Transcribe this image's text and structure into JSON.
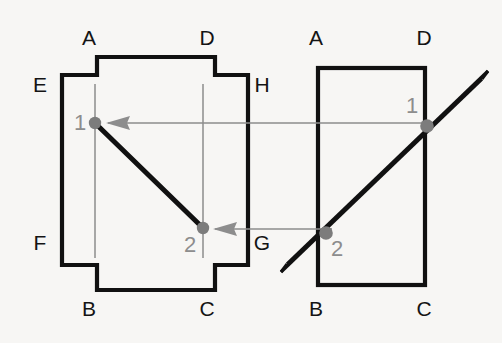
{
  "canvas": {
    "width": 502,
    "height": 343,
    "background": "#f7f6f4"
  },
  "colors": {
    "outline": "#111111",
    "projection_line": "#8d8d8d",
    "point_marker": "#7c7c7c",
    "vertex_label": "#141414",
    "point_label": "#8d8d8d"
  },
  "views": {
    "front": {
      "name": "front-view",
      "shape": "cross-polygon",
      "vertex_labels": [
        {
          "id": "front-label-A",
          "text": "A",
          "x": 89,
          "y": 45
        },
        {
          "id": "front-label-D",
          "text": "D",
          "x": 207,
          "y": 45
        },
        {
          "id": "front-label-E",
          "text": "E",
          "x": 40,
          "y": 92
        },
        {
          "id": "front-label-H",
          "text": "H",
          "x": 255,
          "y": 92
        },
        {
          "id": "front-label-F",
          "text": "F",
          "x": 40,
          "y": 250
        },
        {
          "id": "front-label-G",
          "text": "G",
          "x": 255,
          "y": 250
        },
        {
          "id": "front-label-B",
          "text": "B",
          "x": 89,
          "y": 316
        },
        {
          "id": "front-label-C",
          "text": "C",
          "x": 207,
          "y": 316
        }
      ],
      "points": [
        {
          "id": "front-point-1",
          "label": "1",
          "x": 95,
          "y": 123,
          "label_x": 80,
          "label_y": 128
        },
        {
          "id": "front-point-2",
          "label": "2",
          "x": 203,
          "y": 228,
          "label_x": 186,
          "label_y": 252
        }
      ],
      "line_segment": {
        "from": "1",
        "to": "2"
      }
    },
    "side": {
      "name": "side-view",
      "shape": "rectangle",
      "vertex_labels": [
        {
          "id": "side-label-A",
          "text": "A",
          "x": 310,
          "y": 45
        },
        {
          "id": "side-label-D",
          "text": "D",
          "x": 417,
          "y": 45
        },
        {
          "id": "side-label-B",
          "text": "B",
          "x": 310,
          "y": 316
        },
        {
          "id": "side-label-C",
          "text": "C",
          "x": 417,
          "y": 316
        }
      ],
      "points": [
        {
          "id": "side-point-1",
          "label": "1",
          "x": 425,
          "y": 125,
          "label_x": 411,
          "label_y": 112
        },
        {
          "id": "side-point-2",
          "label": "2",
          "x": 325,
          "y": 232,
          "label_x": 330,
          "label_y": 255
        }
      ],
      "rod": {
        "from_x": 283,
        "from_y": 268,
        "to_x": 486,
        "to_y": 74
      }
    }
  },
  "projection_lines": [
    {
      "id": "projection-line-1",
      "from_x": 425,
      "from_y": 123,
      "to_x": 95,
      "to_y": 123,
      "arrow": "left"
    },
    {
      "id": "projection-line-2",
      "from_x": 325,
      "from_y": 229,
      "to_x": 203,
      "to_y": 229,
      "arrow": "left"
    }
  ],
  "construction_verticals": [
    {
      "id": "construction-vertical-1",
      "x": 95,
      "y1": 84,
      "y2": 258
    },
    {
      "id": "construction-vertical-2",
      "x": 203,
      "y1": 84,
      "y2": 258
    }
  ]
}
